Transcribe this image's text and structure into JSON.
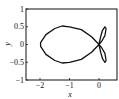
{
  "chart_data": {
    "type": "line",
    "title": "",
    "xlabel": "x",
    "ylabel": "y",
    "xlim": [
      -2.5,
      0.6
    ],
    "ylim": [
      -1,
      1
    ],
    "xticks": [
      -2,
      -1,
      0
    ],
    "xtick_labels": [
      "−2",
      "−1",
      "0"
    ],
    "yticks": [
      -1,
      -0.5,
      0,
      0.5,
      1
    ],
    "ytick_labels": [
      "−1",
      "−0.5",
      "0",
      "0.5",
      "1"
    ],
    "grid": false,
    "legend": null,
    "series": [
      {
        "name": "closed curve",
        "color": "#111111",
        "description": "Large teardrop loop spanning x from -2 to 0 (y from -0.5 to 0.5) joined at the origin to two small petals on the right (x 0 to ~0.2, y ±0.5)",
        "points": [
          [
            0,
            0
          ],
          [
            -0.25,
            0.22
          ],
          [
            -0.6,
            0.42
          ],
          [
            -1.0,
            0.5
          ],
          [
            -1.25,
            0.52
          ],
          [
            -1.5,
            0.45
          ],
          [
            -1.8,
            0.28
          ],
          [
            -1.98,
            0.05
          ],
          [
            -1.98,
            -0.05
          ],
          [
            -1.8,
            -0.28
          ],
          [
            -1.5,
            -0.45
          ],
          [
            -1.25,
            -0.52
          ],
          [
            -1.0,
            -0.5
          ],
          [
            -0.6,
            -0.42
          ],
          [
            -0.25,
            -0.22
          ],
          [
            0,
            0
          ],
          [
            0.05,
            -0.2
          ],
          [
            0.12,
            -0.4
          ],
          [
            0.2,
            -0.5
          ],
          [
            0.24,
            -0.45
          ],
          [
            0.2,
            -0.25
          ],
          [
            0.08,
            -0.08
          ],
          [
            0,
            0
          ],
          [
            0.08,
            0.08
          ],
          [
            0.2,
            0.25
          ],
          [
            0.24,
            0.45
          ],
          [
            0.2,
            0.5
          ],
          [
            0.12,
            0.4
          ],
          [
            0.05,
            0.2
          ],
          [
            0,
            0
          ]
        ]
      }
    ]
  }
}
